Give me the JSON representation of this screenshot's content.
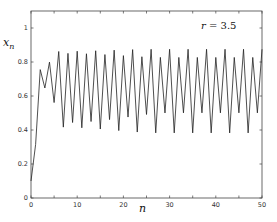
{
  "chart_data": {
    "type": "line",
    "title": "",
    "xlabel": "n",
    "ylabel": "x_n",
    "ylabel_main": "x",
    "ylabel_sub": "n",
    "annotation": {
      "var": "r",
      "eq": " = 3.5"
    },
    "xlim": [
      0,
      50
    ],
    "ylim": [
      0,
      1.1
    ],
    "xticks": [
      0,
      10,
      20,
      30,
      40,
      50
    ],
    "yticks": [
      0,
      0.2,
      0.4,
      0.6,
      0.8,
      1
    ],
    "ytick_labels": [
      "0",
      "0.2",
      "0.4",
      "0.6",
      "0.8",
      "1"
    ],
    "xtick_labels": [
      "0",
      "10",
      "20",
      "30",
      "40",
      "50"
    ],
    "grid": false,
    "series": [
      {
        "name": "logistic map r=3.5",
        "color": "#222222",
        "x": [
          0,
          1,
          2,
          3,
          4,
          5,
          6,
          7,
          8,
          9,
          10,
          11,
          12,
          13,
          14,
          15,
          16,
          17,
          18,
          19,
          20,
          21,
          22,
          23,
          24,
          25,
          26,
          27,
          28,
          29,
          30,
          31,
          32,
          33,
          34,
          35,
          36,
          37,
          38,
          39,
          40,
          41,
          42,
          43,
          44,
          45,
          46,
          47,
          48,
          49,
          50
        ],
        "values": [
          0.1,
          0.315,
          0.7552,
          0.647,
          0.7993,
          0.5614,
          0.8618,
          0.4168,
          0.8508,
          0.444,
          0.8636,
          0.4129,
          0.8485,
          0.4499,
          0.8662,
          0.4057,
          0.8438,
          0.4612,
          0.8697,
          0.3966,
          0.8376,
          0.4762,
          0.873,
          0.388,
          0.831,
          0.4914,
          0.8749,
          0.3832,
          0.8272,
          0.5003,
          0.875,
          0.3828,
          0.8269,
          0.5009,
          0.875,
          0.3828,
          0.8269,
          0.5009,
          0.875,
          0.3828,
          0.8269,
          0.5009,
          0.875,
          0.3828,
          0.8269,
          0.5009,
          0.875,
          0.3828,
          0.8269,
          0.5009,
          0.875
        ]
      }
    ]
  }
}
